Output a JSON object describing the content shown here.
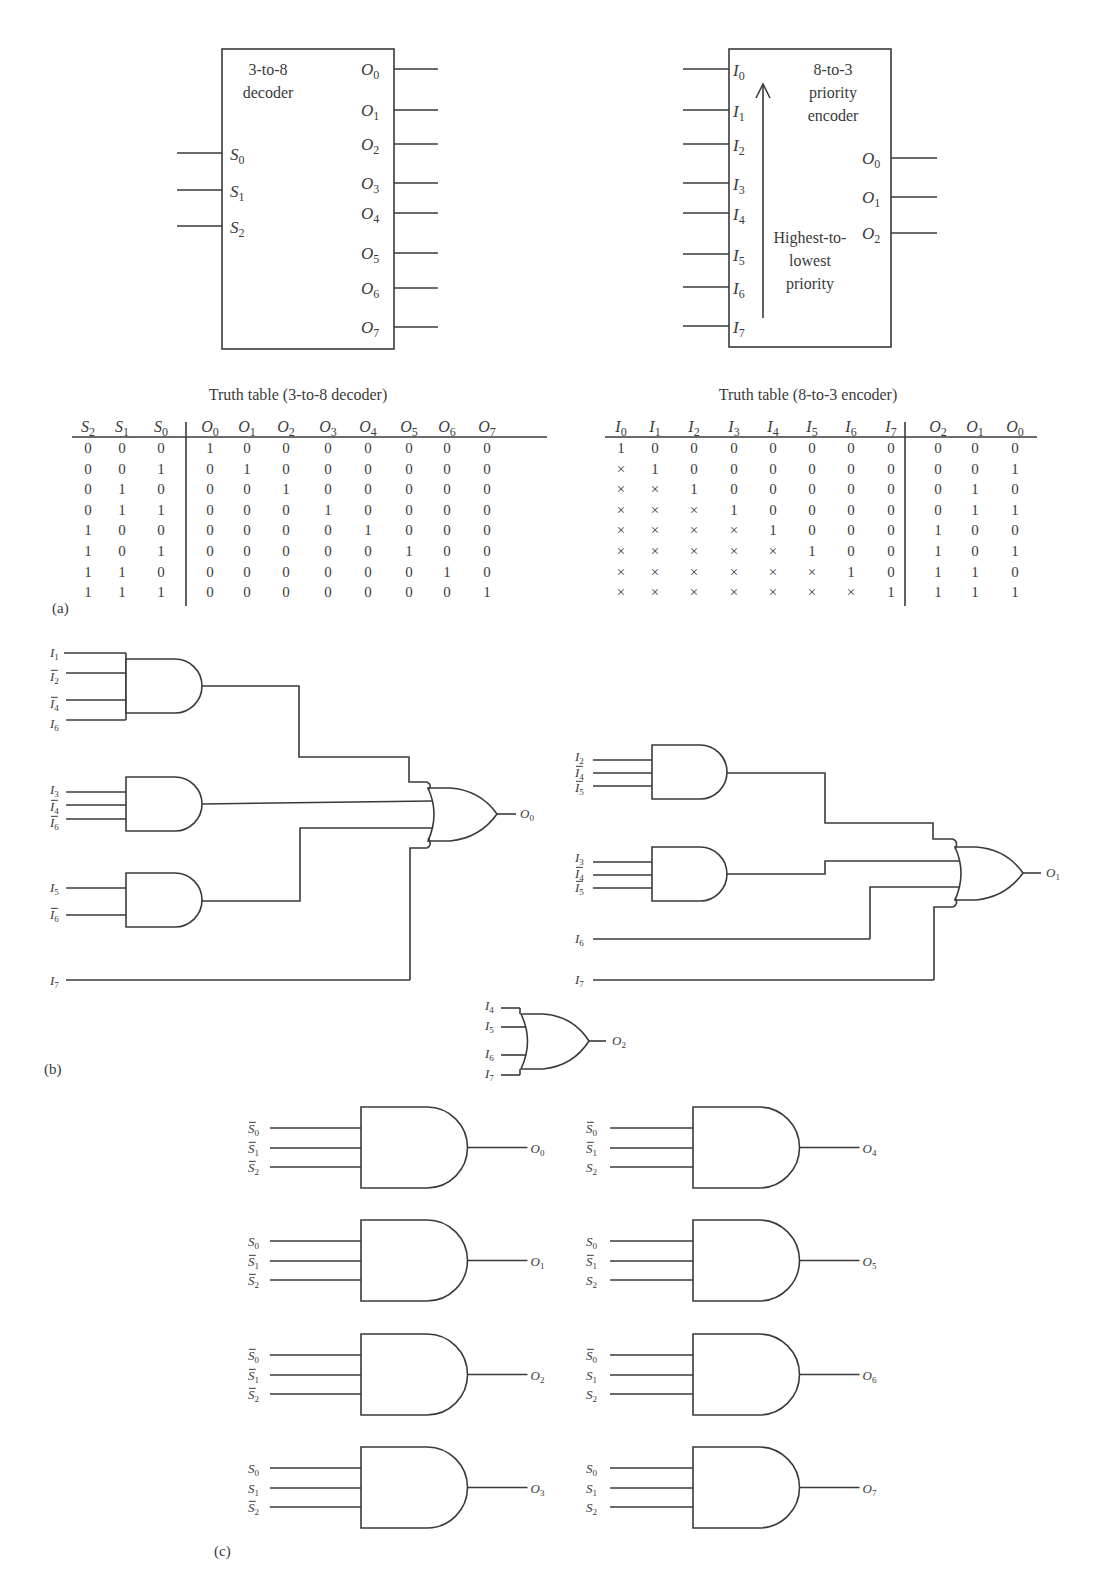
{
  "figure": {
    "panel_labels": {
      "a": "(a)",
      "b": "(b)",
      "c": "(c)"
    }
  },
  "decoder_block": {
    "title_line1": "3-to-8",
    "title_line2": "decoder",
    "inputs": [
      {
        "base": "S",
        "sub": "0"
      },
      {
        "base": "S",
        "sub": "1"
      },
      {
        "base": "S",
        "sub": "2"
      }
    ],
    "outputs": [
      {
        "base": "O",
        "sub": "0"
      },
      {
        "base": "O",
        "sub": "1"
      },
      {
        "base": "O",
        "sub": "2"
      },
      {
        "base": "O",
        "sub": "3"
      },
      {
        "base": "O",
        "sub": "4"
      },
      {
        "base": "O",
        "sub": "5"
      },
      {
        "base": "O",
        "sub": "6"
      },
      {
        "base": "O",
        "sub": "7"
      }
    ]
  },
  "encoder_block": {
    "title_line1": "8-to-3",
    "title_line2": "priority",
    "title_line3": "encoder",
    "priority_line1": "Highest-to-",
    "priority_line2": "lowest",
    "priority_line3": "priority",
    "inputs": [
      {
        "base": "I",
        "sub": "0"
      },
      {
        "base": "I",
        "sub": "1"
      },
      {
        "base": "I",
        "sub": "2"
      },
      {
        "base": "I",
        "sub": "3"
      },
      {
        "base": "I",
        "sub": "4"
      },
      {
        "base": "I",
        "sub": "5"
      },
      {
        "base": "I",
        "sub": "6"
      },
      {
        "base": "I",
        "sub": "7"
      }
    ],
    "outputs": [
      {
        "base": "O",
        "sub": "0"
      },
      {
        "base": "O",
        "sub": "1"
      },
      {
        "base": "O",
        "sub": "2"
      }
    ]
  },
  "decoder_truth_table": {
    "title": "Truth table (3-to-8 decoder)",
    "headers": [
      {
        "base": "S",
        "sub": "2"
      },
      {
        "base": "S",
        "sub": "1"
      },
      {
        "base": "S",
        "sub": "0"
      },
      {
        "base": "O",
        "sub": "0"
      },
      {
        "base": "O",
        "sub": "1"
      },
      {
        "base": "O",
        "sub": "2"
      },
      {
        "base": "O",
        "sub": "3"
      },
      {
        "base": "O",
        "sub": "4"
      },
      {
        "base": "O",
        "sub": "5"
      },
      {
        "base": "O",
        "sub": "6"
      },
      {
        "base": "O",
        "sub": "7"
      }
    ],
    "input_columns": 3,
    "rows": [
      [
        "0",
        "0",
        "0",
        "1",
        "0",
        "0",
        "0",
        "0",
        "0",
        "0",
        "0"
      ],
      [
        "0",
        "0",
        "1",
        "0",
        "1",
        "0",
        "0",
        "0",
        "0",
        "0",
        "0"
      ],
      [
        "0",
        "1",
        "0",
        "0",
        "0",
        "1",
        "0",
        "0",
        "0",
        "0",
        "0"
      ],
      [
        "0",
        "1",
        "1",
        "0",
        "0",
        "0",
        "1",
        "0",
        "0",
        "0",
        "0"
      ],
      [
        "1",
        "0",
        "0",
        "0",
        "0",
        "0",
        "0",
        "1",
        "0",
        "0",
        "0"
      ],
      [
        "1",
        "0",
        "1",
        "0",
        "0",
        "0",
        "0",
        "0",
        "1",
        "0",
        "0"
      ],
      [
        "1",
        "1",
        "0",
        "0",
        "0",
        "0",
        "0",
        "0",
        "0",
        "1",
        "0"
      ],
      [
        "1",
        "1",
        "1",
        "0",
        "0",
        "0",
        "0",
        "0",
        "0",
        "0",
        "1"
      ]
    ]
  },
  "encoder_truth_table": {
    "title": "Truth table (8-to-3 encoder)",
    "headers": [
      {
        "base": "I",
        "sub": "0"
      },
      {
        "base": "I",
        "sub": "1"
      },
      {
        "base": "I",
        "sub": "2"
      },
      {
        "base": "I",
        "sub": "3"
      },
      {
        "base": "I",
        "sub": "4"
      },
      {
        "base": "I",
        "sub": "5"
      },
      {
        "base": "I",
        "sub": "6"
      },
      {
        "base": "I",
        "sub": "7"
      },
      {
        "base": "O",
        "sub": "2"
      },
      {
        "base": "O",
        "sub": "1"
      },
      {
        "base": "O",
        "sub": "0"
      }
    ],
    "input_columns": 8,
    "rows": [
      [
        "1",
        "0",
        "0",
        "0",
        "0",
        "0",
        "0",
        "0",
        "0",
        "0",
        "0"
      ],
      [
        "×",
        "1",
        "0",
        "0",
        "0",
        "0",
        "0",
        "0",
        "0",
        "0",
        "1"
      ],
      [
        "×",
        "×",
        "1",
        "0",
        "0",
        "0",
        "0",
        "0",
        "0",
        "1",
        "0"
      ],
      [
        "×",
        "×",
        "×",
        "1",
        "0",
        "0",
        "0",
        "0",
        "0",
        "1",
        "1"
      ],
      [
        "×",
        "×",
        "×",
        "×",
        "1",
        "0",
        "0",
        "0",
        "1",
        "0",
        "0"
      ],
      [
        "×",
        "×",
        "×",
        "×",
        "×",
        "1",
        "0",
        "0",
        "1",
        "0",
        "1"
      ],
      [
        "×",
        "×",
        "×",
        "×",
        "×",
        "×",
        "1",
        "0",
        "1",
        "1",
        "0"
      ],
      [
        "×",
        "×",
        "×",
        "×",
        "×",
        "×",
        "×",
        "1",
        "1",
        "1",
        "1"
      ]
    ]
  },
  "encoder_circuit": {
    "o0": {
      "gate1_inputs": [
        {
          "base": "I",
          "sub": "1",
          "bar": false
        },
        {
          "base": "I",
          "sub": "2",
          "bar": true
        },
        {
          "base": "I",
          "sub": "4",
          "bar": true
        },
        {
          "base": "I",
          "sub": "6",
          "bar": false
        }
      ],
      "gate2_inputs": [
        {
          "base": "I",
          "sub": "3",
          "bar": false
        },
        {
          "base": "I",
          "sub": "4",
          "bar": true
        },
        {
          "base": "I",
          "sub": "6",
          "bar": true
        }
      ],
      "gate3_inputs": [
        {
          "base": "I",
          "sub": "5",
          "bar": false
        },
        {
          "base": "I",
          "sub": "6",
          "bar": true
        }
      ],
      "direct_input": {
        "base": "I",
        "sub": "7",
        "bar": false
      },
      "output": {
        "base": "O",
        "sub": "0"
      }
    },
    "o1": {
      "gate1_inputs": [
        {
          "base": "I",
          "sub": "2",
          "bar": false
        },
        {
          "base": "I",
          "sub": "4",
          "bar": true
        },
        {
          "base": "I",
          "sub": "5",
          "bar": true
        }
      ],
      "gate2_inputs": [
        {
          "base": "I",
          "sub": "3",
          "bar": false
        },
        {
          "base": "I",
          "sub": "4",
          "bar": true
        },
        {
          "base": "I",
          "sub": "5",
          "bar": true
        }
      ],
      "direct_inputs": [
        {
          "base": "I",
          "sub": "6",
          "bar": false
        },
        {
          "base": "I",
          "sub": "7",
          "bar": false
        }
      ],
      "output": {
        "base": "O",
        "sub": "1"
      }
    },
    "o2": {
      "inputs": [
        {
          "base": "I",
          "sub": "4",
          "bar": false
        },
        {
          "base": "I",
          "sub": "5",
          "bar": false
        },
        {
          "base": "I",
          "sub": "6",
          "bar": false
        },
        {
          "base": "I",
          "sub": "7",
          "bar": false
        }
      ],
      "output": {
        "base": "O",
        "sub": "2"
      }
    }
  },
  "decoder_circuit": {
    "gates": [
      {
        "output": {
          "base": "O",
          "sub": "0"
        },
        "inputs": [
          {
            "base": "S",
            "sub": "0",
            "bar": true
          },
          {
            "base": "S",
            "sub": "1",
            "bar": true
          },
          {
            "base": "S",
            "sub": "2",
            "bar": true
          }
        ]
      },
      {
        "output": {
          "base": "O",
          "sub": "1"
        },
        "inputs": [
          {
            "base": "S",
            "sub": "0",
            "bar": false
          },
          {
            "base": "S",
            "sub": "1",
            "bar": true
          },
          {
            "base": "S",
            "sub": "2",
            "bar": true
          }
        ]
      },
      {
        "output": {
          "base": "O",
          "sub": "2"
        },
        "inputs": [
          {
            "base": "S",
            "sub": "0",
            "bar": true
          },
          {
            "base": "S",
            "sub": "1",
            "bar": true
          },
          {
            "base": "S",
            "sub": "2",
            "bar": true
          }
        ]
      },
      {
        "output": {
          "base": "O",
          "sub": "3"
        },
        "inputs": [
          {
            "base": "S",
            "sub": "0",
            "bar": false
          },
          {
            "base": "S",
            "sub": "1",
            "bar": false
          },
          {
            "base": "S",
            "sub": "2",
            "bar": true
          }
        ]
      },
      {
        "output": {
          "base": "O",
          "sub": "4"
        },
        "inputs": [
          {
            "base": "S",
            "sub": "0",
            "bar": true
          },
          {
            "base": "S",
            "sub": "1",
            "bar": true
          },
          {
            "base": "S",
            "sub": "2",
            "bar": false
          }
        ]
      },
      {
        "output": {
          "base": "O",
          "sub": "5"
        },
        "inputs": [
          {
            "base": "S",
            "sub": "0",
            "bar": false
          },
          {
            "base": "S",
            "sub": "1",
            "bar": true
          },
          {
            "base": "S",
            "sub": "2",
            "bar": false
          }
        ]
      },
      {
        "output": {
          "base": "O",
          "sub": "6"
        },
        "inputs": [
          {
            "base": "S",
            "sub": "0",
            "bar": true
          },
          {
            "base": "S",
            "sub": "1",
            "bar": false
          },
          {
            "base": "S",
            "sub": "2",
            "bar": false
          }
        ]
      },
      {
        "output": {
          "base": "O",
          "sub": "7"
        },
        "inputs": [
          {
            "base": "S",
            "sub": "0",
            "bar": false
          },
          {
            "base": "S",
            "sub": "1",
            "bar": false
          },
          {
            "base": "S",
            "sub": "2",
            "bar": false
          }
        ]
      }
    ]
  }
}
